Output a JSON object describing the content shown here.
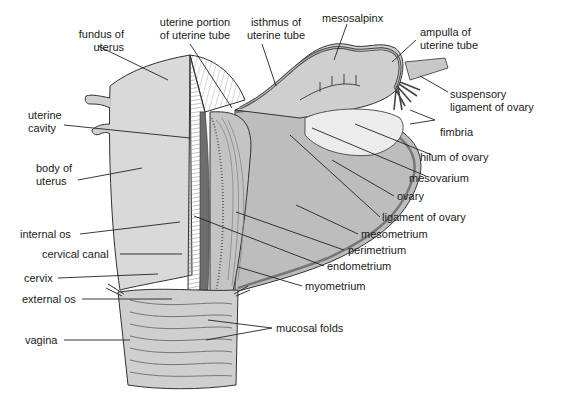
{
  "diagram": {
    "colors": {
      "background": "#ffffff",
      "text": "#1a1a1a",
      "leader": "#222222",
      "tissue_light": "#d9d9d9",
      "tissue_mid": "#b8b8b8",
      "tissue_dark": "#7a7a7a",
      "ovary": "#ececec"
    },
    "labels": {
      "fundus_of_uterus": "fundus of\nuterus",
      "uterine_portion_of_uterine_tube": "uterine portion\nof uterine tube",
      "isthmus_of_uterine_tube": "isthmus of\nuterine tube",
      "mesosalpinx": "mesosalpinx",
      "ampulla_of_uterine_tube": "ampulla of\nuterine tube",
      "suspensory_ligament_of_ovary": "suspensory\nligament of ovary",
      "fimbria": "fimbria",
      "hilum_of_ovary": "hilum of ovary",
      "mesovarium": "mesovarium",
      "ovary": "ovary",
      "ligament_of_ovary": "ligament of ovary",
      "mesometrium": "mesometrium",
      "perimetrium": "perimetrium",
      "endometrium": "endometrium",
      "myometrium": "myometrium",
      "uterine_cavity": "uterine\ncavity",
      "body_of_uterus": "body of\nuterus",
      "internal_os": "internal os",
      "cervical_canal": "cervical canal",
      "cervix": "cervix",
      "external_os": "external os",
      "vagina": "vagina",
      "mucosal_folds": "mucosal folds"
    }
  }
}
